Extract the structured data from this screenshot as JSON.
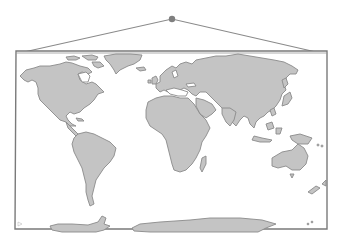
{
  "illustration": {
    "subject": "hanging world map",
    "colors": {
      "background": "#ffffff",
      "frame_stroke": "#7a7a7a",
      "land_fill": "#c4c4c4",
      "land_stroke": "#8a8a8a",
      "nail": "#7f7f7f",
      "string": "#8a8a8a"
    },
    "continents": [
      "North America",
      "Greenland",
      "South America",
      "Europe",
      "Africa",
      "Asia",
      "Australia",
      "Antarctica"
    ]
  }
}
